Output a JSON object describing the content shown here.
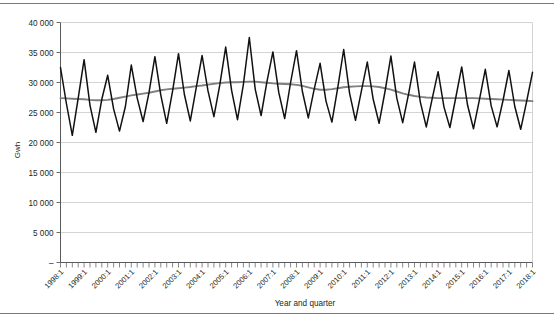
{
  "figure": {
    "background": "#ffffff",
    "rule_color": "#7a7a7a"
  },
  "axis": {
    "y_title": "Gwh",
    "x_title": "Year and quarter",
    "y_ticks": [
      "40 000",
      "35 000",
      "30 000",
      "25 000",
      "20 000",
      "15 000",
      "10 000",
      "5 000",
      "–"
    ],
    "x_ticks": [
      "1998:1",
      "1999:1",
      "2000:1",
      "2001:1",
      "2002:1",
      "2003:1",
      "2004:1",
      "2005:1",
      "2006:1",
      "2007:1",
      "2008:1",
      "2009:1",
      "2010:1",
      "2011:1",
      "2012:1",
      "2013:1",
      "2014:1",
      "2015:1",
      "2016:1",
      "2017:1",
      "2018:1"
    ]
  },
  "chart_data": {
    "type": "line",
    "title": "",
    "subtitle": "",
    "xlabel": "Year and quarter",
    "ylabel": "Gwh",
    "ylim": [
      0,
      40000
    ],
    "ytick_values": [
      0,
      5000,
      10000,
      15000,
      20000,
      25000,
      30000,
      35000,
      40000
    ],
    "grid": true,
    "legend": "none",
    "x_start_label": "1998:1",
    "x_end_label": "2018:1",
    "x_tick_interval_quarters": 4,
    "categories": [
      "1998:1",
      "1998:2",
      "1998:3",
      "1998:4",
      "1999:1",
      "1999:2",
      "1999:3",
      "1999:4",
      "2000:1",
      "2000:2",
      "2000:3",
      "2000:4",
      "2001:1",
      "2001:2",
      "2001:3",
      "2001:4",
      "2002:1",
      "2002:2",
      "2002:3",
      "2002:4",
      "2003:1",
      "2003:2",
      "2003:3",
      "2003:4",
      "2004:1",
      "2004:2",
      "2004:3",
      "2004:4",
      "2005:1",
      "2005:2",
      "2005:3",
      "2005:4",
      "2006:1",
      "2006:2",
      "2006:3",
      "2006:4",
      "2007:1",
      "2007:2",
      "2007:3",
      "2007:4",
      "2008:1",
      "2008:2",
      "2008:3",
      "2008:4",
      "2009:1",
      "2009:2",
      "2009:3",
      "2009:4",
      "2010:1",
      "2010:2",
      "2010:3",
      "2010:4",
      "2011:1",
      "2011:2",
      "2011:3",
      "2011:4",
      "2012:1",
      "2012:2",
      "2012:3",
      "2012:4",
      "2013:1",
      "2013:2",
      "2013:3",
      "2013:4",
      "2014:1",
      "2014:2",
      "2014:3",
      "2014:4",
      "2015:1",
      "2015:2",
      "2015:3",
      "2015:4",
      "2016:1",
      "2016:2",
      "2016:3",
      "2016:4",
      "2017:1",
      "2017:2",
      "2017:3",
      "2017:4",
      "2018:1"
    ],
    "series": [
      {
        "name": "Quarterly electricity consumption",
        "color": "#111111",
        "style": "solid",
        "values": [
          32500,
          26500,
          21200,
          27400,
          33800,
          26200,
          21700,
          27200,
          31200,
          25600,
          21900,
          26000,
          32900,
          27400,
          23500,
          28300,
          34300,
          27900,
          23200,
          28600,
          34800,
          28000,
          23600,
          29100,
          34500,
          28600,
          24300,
          29600,
          35900,
          28700,
          23800,
          29700,
          37500,
          28900,
          24500,
          30200,
          35100,
          28300,
          24000,
          30000,
          35300,
          28500,
          24100,
          28900,
          33200,
          26900,
          23400,
          29200,
          35500,
          28200,
          23700,
          28600,
          33400,
          27200,
          23200,
          28500,
          34400,
          27400,
          23300,
          28100,
          33400,
          26700,
          22600,
          27300,
          31800,
          25900,
          22500,
          27500,
          32600,
          26200,
          22300,
          27100,
          32200,
          26100,
          22600,
          27000,
          32000,
          26000,
          22200,
          26800,
          31700
        ]
      },
      {
        "name": "Trend (smoothed)",
        "color": "#808080",
        "style": "solid",
        "values": [
          27400,
          27350,
          27300,
          27250,
          27200,
          27100,
          27050,
          27050,
          27100,
          27250,
          27450,
          27650,
          27850,
          28000,
          28150,
          28300,
          28500,
          28700,
          28850,
          28950,
          29050,
          29150,
          29250,
          29400,
          29500,
          29650,
          29800,
          29900,
          30000,
          30050,
          30050,
          30100,
          30150,
          30150,
          30050,
          29950,
          29850,
          29800,
          29750,
          29700,
          29600,
          29450,
          29200,
          28950,
          28800,
          28800,
          28900,
          29050,
          29200,
          29300,
          29350,
          29400,
          29400,
          29350,
          29250,
          29050,
          28800,
          28500,
          28200,
          27950,
          27750,
          27600,
          27500,
          27450,
          27400,
          27400,
          27400,
          27400,
          27400,
          27400,
          27400,
          27350,
          27300,
          27250,
          27200,
          27150,
          27100,
          27050,
          27000,
          26950,
          26900
        ]
      }
    ]
  }
}
